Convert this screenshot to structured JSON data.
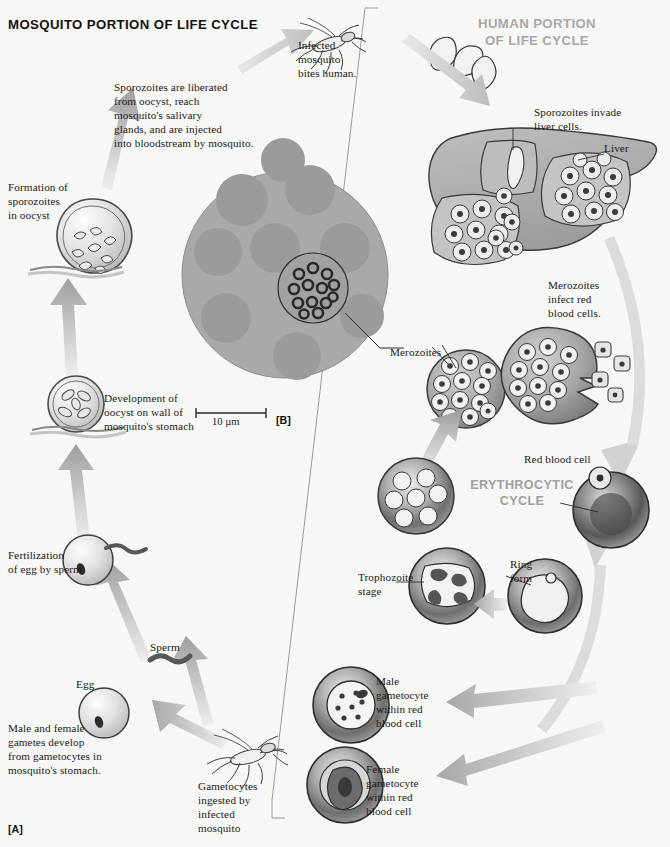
{
  "figure": {
    "panel_a": "[A]",
    "panel_b": "[B]",
    "clipped_caption": "blood cell filled with merozoites of Plasmodium vivax, a parasite species that causes"
  },
  "headers": {
    "mosquito": "MOSQUITO PORTION OF LIFE CYCLE",
    "human": "HUMAN PORTION\nOF LIFE CYCLE",
    "erythrocytic": "ERYTHROCYTIC\nCYCLE"
  },
  "scale_bar": {
    "label": "10 µm"
  },
  "labels": {
    "sporozoites_liberated": "Sporozoites are liberated\nfrom oocyst, reach\nmosquito's salivary\nglands, and are injected\ninto bloodstream by mosquito.",
    "infected_mosquito_bites": "Infected\nmosquito\nbites human.",
    "sporozoites_invade_liver": "Sporozoites invade\nliver cells.",
    "liver": "Liver",
    "merozoites_infect_rbc": "Merozoites\ninfect red\nblood cells.",
    "merozoites": "Merozoites",
    "red_blood_cell": "Red blood cell",
    "ring_form": "Ring\nform",
    "trophozoite_stage": "Trophozoite\nstage",
    "male_gametocyte": "Male\ngametocyte\nwithin red\nblood cell",
    "female_gametocyte": "Female\ngametocyte\nwithin red\nblood cell",
    "gametocytes_ingested": "Gametocytes\ningested by\ninfected\nmosquito",
    "male_female_gametes": "Male and female\ngametes develop\nfrom gametocytes in\nmosquito's stomach.",
    "egg": "Egg",
    "sperm": "Sperm",
    "fertilization": "Fertilization\nof egg by sperm",
    "development_oocyst": "Development of\noocyst on wall of\nmosquito's stomach",
    "formation_sporozoites": "Formation of\nsporozoites\nin oocyst"
  },
  "colors": {
    "background": "#f7f7f5",
    "arrow_light": "#d9d9d9",
    "arrow_mid": "#b9b9b9",
    "cell_fill": "#d8d8d8",
    "cell_stroke": "#3a3a3a",
    "liver_fill": "#b0b0b0",
    "micrograph_fill": "#a9a9a9",
    "micrograph_cell": "#9a9a9a",
    "header_gray": "#a8a8a8",
    "text": "#1a1a1a"
  },
  "diagram": {
    "type": "life-cycle",
    "stages_mosquito": [
      "Gametocytes ingested by infected mosquito",
      "Male and female gametes develop from gametocytes in mosquito's stomach",
      "Fertilization of egg by sperm",
      "Development of oocyst on wall of mosquito's stomach",
      "Formation of sporozoites in oocyst",
      "Infected mosquito bites human"
    ],
    "stages_human": [
      "Sporozoites invade liver cells",
      "Merozoites infect red blood cells",
      "Ring form",
      "Trophozoite stage",
      "Male gametocyte within red blood cell",
      "Female gametocyte within red blood cell"
    ]
  }
}
